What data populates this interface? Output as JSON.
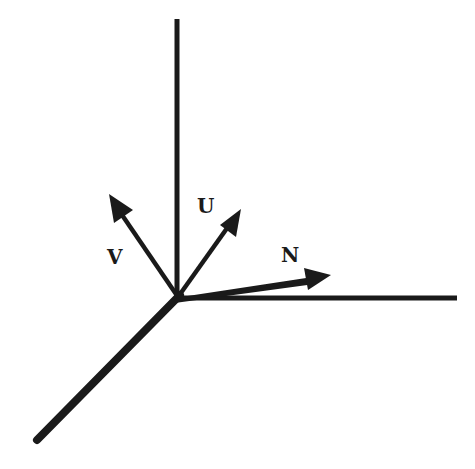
{
  "diagram": {
    "type": "coordinate-frame-vectors",
    "colors": {
      "ink": "#1a1a1a",
      "background": "#ffffff"
    },
    "origin": {
      "x": 178,
      "y": 297
    },
    "axes": [
      {
        "id": "vertical-axis",
        "x1": 177,
        "y1": 19,
        "x2": 177,
        "y2": 297,
        "width": 5
      },
      {
        "id": "horizontal-axis",
        "x1": 178,
        "y1": 298,
        "x2": 457,
        "y2": 298,
        "width": 5
      },
      {
        "id": "diagonal-axis",
        "x1": 178,
        "y1": 297,
        "x2": 37,
        "y2": 440,
        "width": 8
      }
    ],
    "vectors": [
      {
        "id": "V",
        "label": "V",
        "tip": {
          "x": 109,
          "y": 194
        },
        "label_pos": {
          "x": 107,
          "y": 264
        }
      },
      {
        "id": "U",
        "label": "U",
        "tip": {
          "x": 241,
          "y": 209
        },
        "label_pos": {
          "x": 197,
          "y": 213
        }
      },
      {
        "id": "N",
        "label": "N",
        "tip": {
          "x": 331,
          "y": 275
        },
        "label_pos": {
          "x": 281,
          "y": 262
        }
      }
    ]
  }
}
